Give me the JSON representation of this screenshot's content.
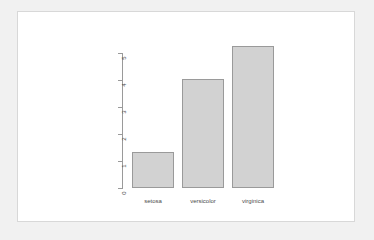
{
  "window": {
    "background_color": "#f1f1f1",
    "panel_color": "#ffffff",
    "panel_border_color": "#d8d8d8"
  },
  "chart_data": {
    "type": "bar",
    "title": "",
    "subtitle": "",
    "xlabel": "",
    "ylabel": "",
    "categories": [
      "setosa",
      "versicolor",
      "virginica"
    ],
    "values": [
      1.35,
      4.05,
      5.25
    ],
    "series": [
      {
        "name": "",
        "values": [
          1.35,
          4.05,
          5.25
        ]
      }
    ],
    "ylim": [
      0,
      5
    ],
    "y_ticks": [
      0,
      1,
      2,
      3,
      4,
      5
    ],
    "y_tick_labels": [
      "0",
      "1",
      "2",
      "3",
      "4",
      "5"
    ],
    "x_tick_labels": [
      "setosa",
      "versicolor",
      "virginica"
    ],
    "grid": false,
    "legend": null,
    "legend_position": "none",
    "bar_fill_color": "#d2d2d2",
    "bar_border_color": "#9a9a9a",
    "axis_color": "#9a9a9a",
    "tick_label_color": "#4a4a4a",
    "y_tick_labels_rotated": true,
    "annotations": []
  }
}
